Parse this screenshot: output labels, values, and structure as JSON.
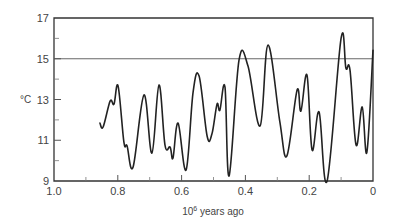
{
  "chart_data": {
    "type": "line",
    "title": "",
    "xlabel": "10^6 years ago",
    "xlabel_base": "10",
    "xlabel_exp": "6",
    "xlabel_rest": " years ago",
    "ylabel": "°C",
    "xlim": [
      1.0,
      0.0
    ],
    "ylim": [
      9,
      17
    ],
    "x_reversed": true,
    "grid": false,
    "reference_line": {
      "y": 15,
      "color": "#555555"
    },
    "x_ticks_major": [
      1.0,
      0.8,
      0.6,
      0.4,
      0.2,
      0
    ],
    "x_tick_labels": [
      "1.0",
      "0.8",
      "0.6",
      "0.4",
      "0.2",
      "0"
    ],
    "x_ticks_minor": [
      0.9,
      0.7,
      0.5,
      0.3,
      0.1
    ],
    "y_ticks_major": [
      9,
      11,
      13,
      15,
      17
    ],
    "y_tick_labels": [
      "9",
      "11",
      "13",
      "15",
      "17"
    ],
    "y_ticks_minor": [
      10,
      12,
      14,
      16
    ],
    "series": [
      {
        "name": "Temperature",
        "color": "#222222",
        "x": [
          0.856,
          0.846,
          0.824,
          0.812,
          0.799,
          0.781,
          0.771,
          0.752,
          0.718,
          0.693,
          0.671,
          0.652,
          0.636,
          0.627,
          0.611,
          0.586,
          0.564,
          0.545,
          0.52,
          0.505,
          0.489,
          0.48,
          0.464,
          0.451,
          0.42,
          0.392,
          0.354,
          0.329,
          0.292,
          0.27,
          0.238,
          0.226,
          0.207,
          0.191,
          0.169,
          0.144,
          0.1,
          0.085,
          0.072,
          0.053,
          0.034,
          0.019,
          0.0
        ],
        "y": [
          11.84,
          11.65,
          12.92,
          12.77,
          13.66,
          10.91,
          10.72,
          9.69,
          13.22,
          10.37,
          13.71,
          10.76,
          10.67,
          10.13,
          11.84,
          9.54,
          13.36,
          14.15,
          11.21,
          11.3,
          12.77,
          12.48,
          13.61,
          9.25,
          14.93,
          14.64,
          11.7,
          15.67,
          11.89,
          10.23,
          13.46,
          12.43,
          14.2,
          10.52,
          12.38,
          9.0,
          16.01,
          14.54,
          14.44,
          10.76,
          12.63,
          10.42,
          15.42
        ]
      }
    ]
  }
}
